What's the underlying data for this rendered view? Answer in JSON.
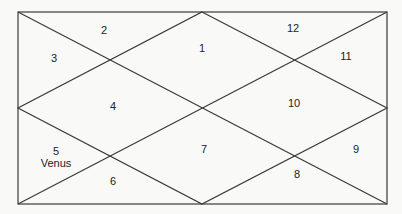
{
  "chart": {
    "type": "north-indian-horoscope",
    "houses": [
      {
        "id": "house-1",
        "number": "1",
        "planets": ""
      },
      {
        "id": "house-2",
        "number": "2",
        "planets": ""
      },
      {
        "id": "house-3",
        "number": "3",
        "planets": ""
      },
      {
        "id": "house-4",
        "number": "4",
        "planets": ""
      },
      {
        "id": "house-5",
        "number": "5",
        "planets": "Venus"
      },
      {
        "id": "house-6",
        "number": "6",
        "planets": ""
      },
      {
        "id": "house-7",
        "number": "7",
        "planets": ""
      },
      {
        "id": "house-8",
        "number": "8",
        "planets": ""
      },
      {
        "id": "house-9",
        "number": "9",
        "planets": ""
      },
      {
        "id": "house-10",
        "number": "10",
        "planets": ""
      },
      {
        "id": "house-11",
        "number": "11",
        "planets": ""
      },
      {
        "id": "house-12",
        "number": "12",
        "planets": ""
      }
    ],
    "colors": {
      "line": "#3a3a3a",
      "background": "#f9f9f7",
      "text": "#222222"
    }
  }
}
